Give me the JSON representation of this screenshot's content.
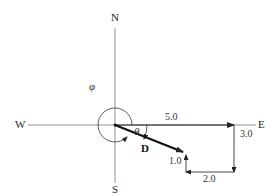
{
  "diagram": {
    "type": "vector-displacement",
    "compass": {
      "north": "N",
      "south": "S",
      "east": "E",
      "west": "W"
    },
    "angles": {
      "theta": "θ",
      "phi": "φ"
    },
    "resultant": {
      "label": "D"
    },
    "displacements": [
      {
        "label": "5.0",
        "direction": "east"
      },
      {
        "label": "3.0",
        "direction": "south"
      },
      {
        "label": "2.0",
        "direction": "west"
      },
      {
        "label": "1.0",
        "direction": "north"
      }
    ],
    "colors": {
      "axis": "#666666",
      "vector": "#222222",
      "resultant": "#111111",
      "background": "#ffffff"
    }
  }
}
